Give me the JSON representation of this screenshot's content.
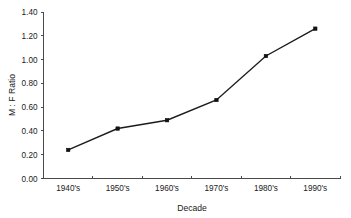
{
  "chart_data": {
    "type": "line",
    "title": "",
    "xlabel": "Decade",
    "ylabel": "M : F Ratio",
    "categories": [
      "1940's",
      "1950's",
      "1960's",
      "1970's",
      "1980's",
      "1990's"
    ],
    "values": [
      0.24,
      0.42,
      0.49,
      0.66,
      1.03,
      1.26
    ],
    "series": [
      {
        "name": "M : F Ratio",
        "values": [
          0.24,
          0.42,
          0.49,
          0.66,
          1.03,
          1.26
        ]
      }
    ],
    "ylim": [
      0.0,
      1.4
    ],
    "ytick_labels": [
      "0.00",
      "0.20",
      "0.40",
      "0.60",
      "0.80",
      "1.00",
      "1.20",
      "1.40"
    ],
    "ytick_values": [
      0.0,
      0.2,
      0.4,
      0.6,
      0.8,
      1.0,
      1.2,
      1.4
    ],
    "xtick_labels": [
      "1940's",
      "1950's",
      "1960's",
      "1970's",
      "1980's",
      "1990's"
    ],
    "grid": false,
    "legend": "none",
    "marker": "square",
    "line_color": "#1c1c1c",
    "marker_color": "#111111",
    "axis_color": "#4a4a4a",
    "background_color": "#ffffff"
  },
  "axes": {
    "y_title": "M : F Ratio",
    "x_title": "Decade"
  }
}
